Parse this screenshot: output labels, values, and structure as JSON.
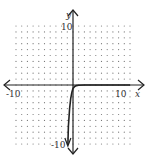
{
  "chart_data": {
    "type": "line",
    "title": "",
    "xlabel": "x",
    "ylabel": "y",
    "xlim": [
      -10,
      10
    ],
    "ylim": [
      -10,
      10
    ],
    "grid": "dotted",
    "tick_labels": {
      "x_min": "-10",
      "x_max": "10",
      "y_max": "10",
      "y_min": "-10"
    },
    "series": [
      {
        "name": "f(x)",
        "x": [
          -0.9,
          -0.8,
          -0.6,
          -0.4,
          -0.2,
          0,
          0.3,
          0.6,
          1,
          2,
          4,
          6,
          8,
          10
        ],
        "y": [
          -10,
          -7,
          -4,
          -2.3,
          -1.2,
          -0.6,
          -0.25,
          -0.1,
          -0.03,
          0,
          0,
          0,
          0,
          0
        ]
      }
    ]
  }
}
